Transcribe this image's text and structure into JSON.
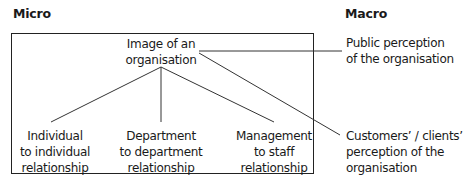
{
  "headings": {
    "micro": "Micro",
    "macro": "Macro"
  },
  "center_node": {
    "lines": [
      "Image of an",
      "organisation"
    ]
  },
  "micro_nodes": [
    {
      "lines": [
        "Individual",
        "to individual",
        "relationship"
      ]
    },
    {
      "lines": [
        "Department",
        "to department",
        "relationship"
      ]
    },
    {
      "lines": [
        "Management",
        "to staff",
        "relationship"
      ]
    }
  ],
  "macro_nodes": [
    {
      "lines": [
        "Public perception",
        "of the organisation"
      ]
    },
    {
      "lines": [
        "Customers’ / clients’",
        "perception of the",
        "organisation"
      ]
    }
  ]
}
